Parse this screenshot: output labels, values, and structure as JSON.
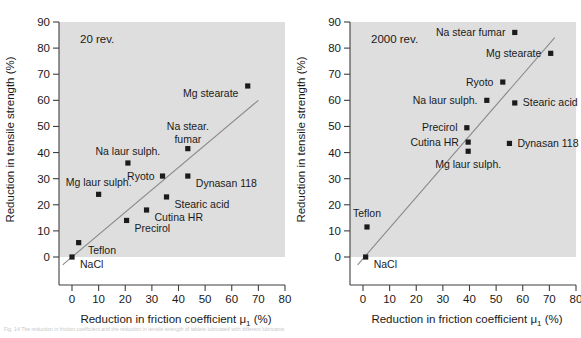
{
  "figure": {
    "caption": "Fig. 14  The reduction in friction coefficient and the reduction in tensile strength of tablets lubricated with different lubricants"
  },
  "chart_data": [
    {
      "type": "scatter",
      "panel_id": "left",
      "title": "",
      "annotation": "20 rev.",
      "xlabel": "Reduction in friction coefficient μ",
      "xlabel_sub": "1",
      "xlabel_unit": "(%)",
      "ylabel": "Reduction in tensile strength (%)",
      "xlim": [
        -5,
        80
      ],
      "ylim": [
        -8,
        90
      ],
      "xticks": [
        0,
        10,
        20,
        30,
        40,
        50,
        60,
        70,
        80
      ],
      "yticks": [
        0,
        10,
        20,
        30,
        40,
        50,
        60,
        70,
        80,
        90
      ],
      "grid": false,
      "legend": "none",
      "trendline": {
        "x0": -3.5,
        "y0": -3.0,
        "x1": 70.0,
        "y1": 60.0
      },
      "points": [
        {
          "label": "NaCl",
          "x": 0.0,
          "y": 0.0,
          "lx": 3.0,
          "ly": -3.0,
          "align": "start"
        },
        {
          "label": "Teflon",
          "x": 2.5,
          "y": 5.5,
          "lx": 6.0,
          "ly": 2.5,
          "align": "start"
        },
        {
          "label": "Mg laur sulph.",
          "x": 10.0,
          "y": 24.0,
          "lx": 10.0,
          "ly": 28.5,
          "align": "middle"
        },
        {
          "label": "Na laur sulph.",
          "x": 21.0,
          "y": 36.0,
          "lx": 21.0,
          "ly": 40.5,
          "align": "middle"
        },
        {
          "label": "Precirol",
          "x": 20.5,
          "y": 14.0,
          "lx": 23.5,
          "ly": 11.0,
          "align": "start"
        },
        {
          "label": "Cutina HR",
          "x": 28.0,
          "y": 18.0,
          "lx": 31.0,
          "ly": 15.0,
          "align": "start"
        },
        {
          "label": "Ryoto",
          "x": 34.0,
          "y": 31.0,
          "lx": 31.0,
          "ly": 31.0,
          "align": "end"
        },
        {
          "label": "Stearic acid",
          "x": 35.5,
          "y": 23.0,
          "lx": 38.5,
          "ly": 20.0,
          "align": "start"
        },
        {
          "label": "Na stear.",
          "x": 43.5,
          "y": 41.5,
          "lx": 43.5,
          "ly": 50.0,
          "align": "middle"
        },
        {
          "label": "fumar",
          "x": null,
          "y": null,
          "lx": 43.5,
          "ly": 45.0,
          "align": "middle"
        },
        {
          "label": "Dynasan 118",
          "x": 43.5,
          "y": 31.0,
          "lx": 46.5,
          "ly": 28.0,
          "align": "start"
        },
        {
          "label": "Mg stearate",
          "x": 66.0,
          "y": 65.5,
          "lx": 62.5,
          "ly": 62.5,
          "align": "end"
        }
      ]
    },
    {
      "type": "scatter",
      "panel_id": "right",
      "title": "",
      "annotation": "2000 rev.",
      "xlabel": "Reduction in friction coefficient μ",
      "xlabel_sub": "1",
      "xlabel_unit": "(%)",
      "ylabel": "Reduction in tensile strength (%)",
      "xlim": [
        -5,
        80
      ],
      "ylim": [
        -8,
        90
      ],
      "xticks": [
        0,
        10,
        20,
        30,
        40,
        50,
        60,
        70,
        80
      ],
      "yticks": [
        0,
        10,
        20,
        30,
        40,
        50,
        60,
        70,
        80,
        90
      ],
      "grid": false,
      "legend": "none",
      "trendline": {
        "x0": -2.0,
        "y0": -3.0,
        "x1": 72.0,
        "y1": 84.0
      },
      "points": [
        {
          "label": "NaCl",
          "x": 1.0,
          "y": 0.0,
          "lx": 4.0,
          "ly": -3.0,
          "align": "start"
        },
        {
          "label": "Teflon",
          "x": 1.5,
          "y": 11.5,
          "lx": 1.5,
          "ly": 16.5,
          "align": "middle"
        },
        {
          "label": "Mg laur sulph.",
          "x": 39.5,
          "y": 40.5,
          "lx": 39.5,
          "ly": 35.5,
          "align": "middle"
        },
        {
          "label": "Cutina HR",
          "x": 39.5,
          "y": 44.0,
          "lx": 36.0,
          "ly": 44.0,
          "align": "end"
        },
        {
          "label": "Precirol",
          "x": 39.0,
          "y": 49.5,
          "lx": 35.5,
          "ly": 49.5,
          "align": "end"
        },
        {
          "label": "Dynasan 118",
          "x": 55.0,
          "y": 43.5,
          "lx": 58.0,
          "ly": 43.5,
          "align": "start"
        },
        {
          "label": "Na laur sulph.",
          "x": 46.5,
          "y": 60.0,
          "lx": 43.0,
          "ly": 60.0,
          "align": "end"
        },
        {
          "label": "Stearic acid",
          "x": 57.0,
          "y": 59.0,
          "lx": 60.0,
          "ly": 59.0,
          "align": "start"
        },
        {
          "label": "Ryoto",
          "x": 52.5,
          "y": 67.0,
          "lx": 49.0,
          "ly": 67.0,
          "align": "end"
        },
        {
          "label": "Mg stearate",
          "x": 70.5,
          "y": 78.0,
          "lx": 67.0,
          "ly": 78.0,
          "align": "end"
        },
        {
          "label": "Na stear fumar",
          "x": 57.0,
          "y": 86.0,
          "lx": 53.5,
          "ly": 86.0,
          "align": "end"
        }
      ]
    }
  ]
}
